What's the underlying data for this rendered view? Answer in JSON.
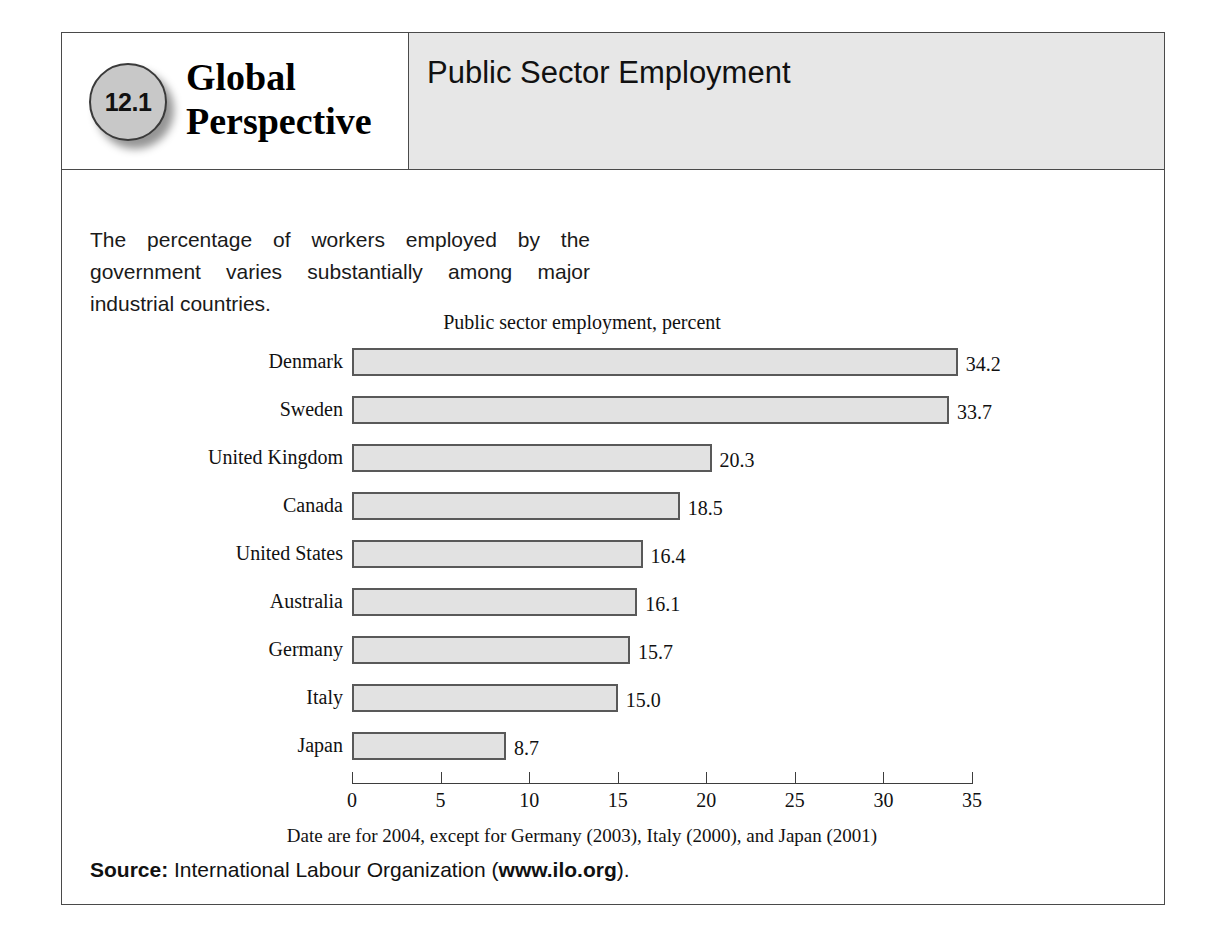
{
  "figure": {
    "badge_number": "12.1",
    "series_line1": "Global",
    "series_line2": "Perspective",
    "title": "Public Sector Employment",
    "lede": "The percentage of workers employed by the government varies substantially among major industrial countries.",
    "footnote": "Date are for 2004, except for Germany (2003), Italy (2000), and Japan (2001)",
    "source": {
      "label": "Source:",
      "text": " International Labour Organization (",
      "link": "www.ilo.org",
      "tail": ")."
    }
  },
  "colors": {
    "bar_fill": "#e2e2e2",
    "bar_border": "#595959",
    "header_panel": "#e7e7e7",
    "badge_fill": "#c8c8c8",
    "frame": "#4a4a4a"
  },
  "chart_data": {
    "type": "bar",
    "orientation": "horizontal",
    "title": "Public sector employment, percent",
    "xlabel": "",
    "ylabel": "",
    "xlim": [
      0,
      35
    ],
    "xticks": [
      0,
      5,
      10,
      15,
      20,
      25,
      30,
      35
    ],
    "xtick_labels": [
      "0",
      "5",
      "10",
      "15",
      "20",
      "25",
      "30",
      "35"
    ],
    "grid": false,
    "legend": false,
    "categories": [
      "Denmark",
      "Sweden",
      "United Kingdom",
      "Canada",
      "United States",
      "Australia",
      "Germany",
      "Italy",
      "Japan"
    ],
    "values": [
      34.2,
      33.7,
      20.3,
      18.5,
      16.4,
      16.1,
      15.7,
      15.0,
      8.7
    ],
    "value_labels": [
      "34.2",
      "33.7",
      "20.3",
      "18.5",
      "16.4",
      "16.1",
      "15.7",
      "15.0",
      "8.7"
    ],
    "note": "Date are for 2004, except for Germany (2003), Italy (2000), and Japan (2001)"
  }
}
